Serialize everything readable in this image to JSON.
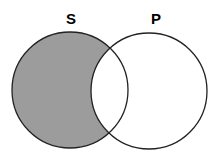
{
  "diagram": {
    "type": "venn",
    "sets": [
      {
        "label": "S",
        "shaded": "S-only region"
      },
      {
        "label": "P",
        "shaded": "none"
      }
    ],
    "colors": {
      "shade": "#9c9c9c",
      "stroke": "#222222",
      "background": "#ffffff"
    }
  }
}
